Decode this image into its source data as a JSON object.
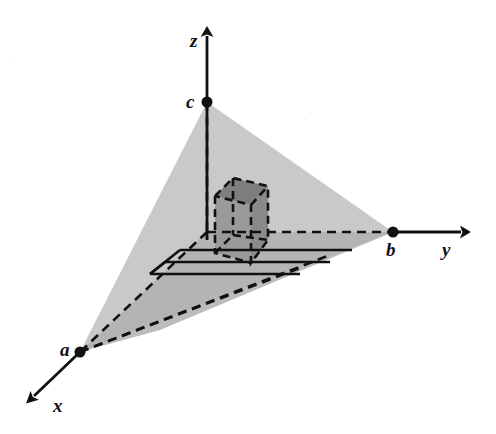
{
  "figure": {
    "background_color": "#ffffff",
    "width": 496,
    "height": 434
  },
  "colors": {
    "ink": "#111111",
    "plane_fill": "#c9c9c9",
    "plane_fill_shadow": "#b0b0b0",
    "box_fill_front": "#9a9a9a",
    "box_fill_side": "#8a8a8a",
    "box_fill_top": "#7e7e7e",
    "speck": "#b9b9b9"
  },
  "axes": [
    {
      "name": "z-axis",
      "label": "z",
      "label_x": 190,
      "label_y": 47,
      "from_x": 207,
      "from_y": 240,
      "to_x": 207,
      "to_y": 36,
      "direction": "up"
    },
    {
      "name": "y-axis",
      "label": "y",
      "label_x": 442,
      "label_y": 256,
      "from_x": 393,
      "from_y": 232,
      "to_x": 461,
      "to_y": 232,
      "direction": "right"
    },
    {
      "name": "x-axis",
      "label": "x",
      "label_x": 53,
      "label_y": 412,
      "from_x": 80,
      "from_y": 352,
      "to_x": 34,
      "to_y": 396,
      "direction": "down-left"
    }
  ],
  "vertices": [
    {
      "name": "vertex-c",
      "label": "c",
      "axis": "z",
      "point_x": 207,
      "point_y": 102,
      "label_x": 186,
      "label_y": 108,
      "dot_radius": 5.5
    },
    {
      "name": "vertex-b",
      "label": "b",
      "axis": "y",
      "point_x": 393,
      "point_y": 232,
      "label_x": 386,
      "label_y": 256,
      "dot_radius": 5.5
    },
    {
      "name": "vertex-a",
      "label": "a",
      "axis": "x",
      "point_x": 80,
      "point_y": 352,
      "label_x": 60,
      "label_y": 356,
      "dot_radius": 5.5
    }
  ],
  "plane": {
    "name": "intercept-plane",
    "polygon": "207,102 393,232 80,352",
    "fill": "#c9c9c9",
    "description": "Shaded triangular plane joining the three axis intercepts"
  },
  "shadow_region": {
    "name": "base-shadow-region",
    "polygon": "207,232 393,232 160,330 80,352",
    "fill": "#b0b0b0",
    "description": "Darker shaded quadrilateral in lower portion of the plane"
  },
  "origin": {
    "name": "origin-point",
    "x": 207,
    "y": 232
  },
  "box": {
    "name": "inscribed-box",
    "front_face": "215,196 215,253 251,263 251,205",
    "side_face": "251,205 251,263 268,240 268,186",
    "top_face": "215,196 251,205 268,186 233,178",
    "fill_front": "#9a9a9a",
    "fill_side": "#8a8a8a",
    "fill_top": "#7e7e7e"
  },
  "dashed_edges": [
    {
      "name": "dashed-z-drop",
      "x1": 207,
      "y1": 102,
      "x2": 207,
      "y2": 238
    },
    {
      "name": "dashed-y-base",
      "x1": 207,
      "y1": 232,
      "x2": 393,
      "y2": 232
    },
    {
      "name": "dashed-x-base",
      "x1": 207,
      "y1": 232,
      "x2": 80,
      "y2": 352
    },
    {
      "name": "dashed-base-edge-lower",
      "x1": 80,
      "y1": 352,
      "x2": 330,
      "y2": 255
    },
    {
      "name": "dashed-base-edge-mid",
      "x1": 80,
      "y1": 352,
      "x2": 300,
      "y2": 268
    }
  ],
  "grid_lines": [
    {
      "name": "grid-line-upper",
      "x1": 180,
      "y1": 250,
      "x2": 352,
      "y2": 250
    },
    {
      "name": "grid-line-middle",
      "x1": 165,
      "y1": 262,
      "x2": 330,
      "y2": 262
    },
    {
      "name": "grid-line-lower",
      "x1": 150,
      "y1": 274,
      "x2": 300,
      "y2": 274
    }
  ],
  "speck_marks": [
    {
      "name": "speck-upper-left",
      "x": 14,
      "y": 62,
      "glyph": "·"
    },
    {
      "name": "speck-upper-right",
      "x": 310,
      "y": 115,
      "glyph": "·"
    }
  ]
}
